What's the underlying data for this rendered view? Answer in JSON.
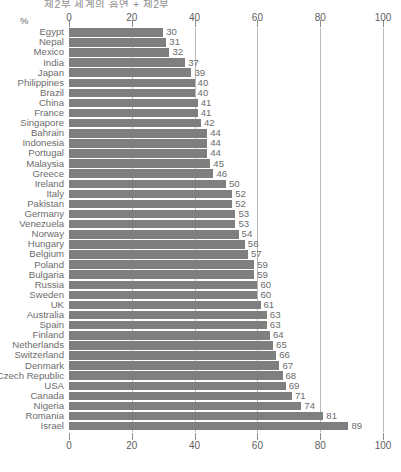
{
  "top_caption": "제2부 세계의 흡연 + 제2부",
  "unit_label": "%",
  "axis": {
    "ticks": [
      0,
      20,
      40,
      60,
      80,
      100
    ],
    "min": 0,
    "max": 100
  },
  "colors": {
    "bar": "#7f7f7f",
    "gridline": "#b9b9b9",
    "text": "#6d6d6d"
  },
  "chart_data": {
    "type": "bar",
    "orientation": "horizontal",
    "title": "",
    "xlabel": "%",
    "ylabel": "",
    "xlim": [
      0,
      100
    ],
    "grid": true,
    "legend": "none",
    "categories": [
      "Egypt",
      "Nepal",
      "Mexico",
      "India",
      "Japan",
      "Philippines",
      "Brazil",
      "China",
      "France",
      "Singapore",
      "Bahrain",
      "Indonesia",
      "Portugal",
      "Malaysia",
      "Greece",
      "Ireland",
      "Italy",
      "Pakistan",
      "Germany",
      "Venezuela",
      "Norway",
      "Hungary",
      "Belgium",
      "Poland",
      "Bulgaria",
      "Russia",
      "Sweden",
      "UK",
      "Australia",
      "Spain",
      "Finland",
      "Netherlands",
      "Switzerland",
      "Denmark",
      "Czech Republic",
      "USA",
      "Canada",
      "Nigeria",
      "Romania",
      "Israel"
    ],
    "values": [
      30,
      31,
      32,
      37,
      39,
      40,
      40,
      41,
      41,
      42,
      44,
      44,
      44,
      45,
      46,
      50,
      52,
      52,
      53,
      53,
      54,
      56,
      57,
      59,
      59,
      60,
      60,
      61,
      63,
      63,
      64,
      65,
      66,
      67,
      68,
      69,
      71,
      74,
      81,
      89
    ]
  }
}
